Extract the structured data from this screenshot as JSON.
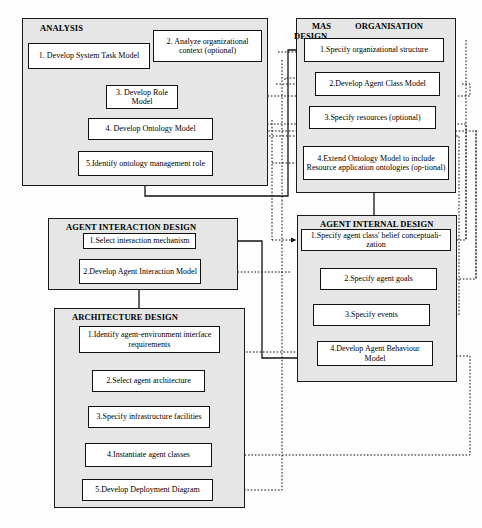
{
  "diagram": {
    "style": {
      "panel_fill": "#e6e6e6",
      "node_fill": "#ffffff",
      "line_color": "#111111",
      "page_bg": "#fdfdfd"
    },
    "panels": [
      {
        "id": "analysis",
        "label": "ANALYSIS",
        "label2": "",
        "x": 22,
        "y": 18,
        "w": 246,
        "h": 168,
        "title_x": 40,
        "title_y": 24
      },
      {
        "id": "mas-organisation-design",
        "label": "MAS",
        "label2": "ORGANISATION",
        "label3": "DESIGN",
        "x": 296,
        "y": 18,
        "w": 160,
        "h": 175,
        "title_x": 312,
        "title_y": 22
      },
      {
        "id": "agent-interaction-design",
        "label": "AGENT INTERACTION DESIGN",
        "x": 48,
        "y": 218,
        "w": 190,
        "h": 72,
        "title_x": 66,
        "title_y": 222
      },
      {
        "id": "agent-internal-design",
        "label": "AGENT INTERNAL DESIGN",
        "x": 297,
        "y": 215,
        "w": 160,
        "h": 167,
        "title_x": 320,
        "title_y": 219
      },
      {
        "id": "architecture-design",
        "label": "ARCHITECTURE DESIGN",
        "x": 54,
        "y": 308,
        "w": 191,
        "h": 200,
        "title_x": 72,
        "title_y": 312
      }
    ],
    "nodes": [
      {
        "id": "a1",
        "panel": "analysis",
        "text": "1. Develop System Task Model",
        "x": 28,
        "y": 43,
        "w": 122,
        "h": 26
      },
      {
        "id": "a2",
        "panel": "analysis",
        "text": "2. Analyze organizational context (optional)",
        "x": 153,
        "y": 30,
        "w": 109,
        "h": 32
      },
      {
        "id": "a3",
        "panel": "analysis",
        "text": "3. Develop Role Model",
        "x": 106,
        "y": 85,
        "w": 72,
        "h": 24
      },
      {
        "id": "a4",
        "panel": "analysis",
        "text": "4. Develop Ontology Model",
        "x": 88,
        "y": 118,
        "w": 125,
        "h": 22
      },
      {
        "id": "a5",
        "panel": "analysis",
        "text": "5.Identify ontology management role",
        "x": 78,
        "y": 151,
        "w": 135,
        "h": 25
      },
      {
        "id": "m1",
        "panel": "mas-organisation-design",
        "text": "1.Specify  organizational structure",
        "x": 304,
        "y": 38,
        "w": 140,
        "h": 24
      },
      {
        "id": "m2",
        "panel": "mas-organisation-design",
        "text": "2.Develop Agent Class Model",
        "x": 315,
        "y": 72,
        "w": 125,
        "h": 24
      },
      {
        "id": "m3",
        "panel": "mas-organisation-design",
        "text": "3.Specify resources (optional)",
        "x": 309,
        "y": 106,
        "w": 127,
        "h": 23
      },
      {
        "id": "m4",
        "panel": "mas-organisation-design",
        "text": "4.Extend Ontology Model to include Resource application ontologies (op-tional)",
        "x": 303,
        "y": 146,
        "w": 146,
        "h": 34
      },
      {
        "id": "i1",
        "panel": "agent-interaction-design",
        "text": "1.Select interaction mechanism",
        "x": 83,
        "y": 233,
        "w": 113,
        "h": 16
      },
      {
        "id": "i2",
        "panel": "agent-interaction-design",
        "text": "2.Develop Agent Interaction Model",
        "x": 79,
        "y": 259,
        "w": 122,
        "h": 25
      },
      {
        "id": "n1",
        "panel": "agent-internal-design",
        "text": "1.Specify agent class' belief conceptuali-zation",
        "x": 301,
        "y": 229,
        "w": 150,
        "h": 22
      },
      {
        "id": "n2",
        "panel": "agent-internal-design",
        "text": "2.Specify agent goals",
        "x": 320,
        "y": 268,
        "w": 117,
        "h": 22
      },
      {
        "id": "n3",
        "panel": "agent-internal-design",
        "text": "3.Specify events",
        "x": 313,
        "y": 304,
        "w": 117,
        "h": 22
      },
      {
        "id": "n4",
        "panel": "agent-internal-design",
        "text": "4.Develop Agent Behaviour Model",
        "x": 317,
        "y": 341,
        "w": 116,
        "h": 25
      },
      {
        "id": "r1",
        "panel": "architecture-design",
        "text": "1.Identify agent-environment interface requirements",
        "x": 79,
        "y": 326,
        "w": 141,
        "h": 27
      },
      {
        "id": "r2",
        "panel": "architecture-design",
        "text": "2.Select agent architecture",
        "x": 92,
        "y": 370,
        "w": 113,
        "h": 22
      },
      {
        "id": "r3",
        "panel": "architecture-design",
        "text": "3.Specify infrastructure facilities",
        "x": 88,
        "y": 406,
        "w": 122,
        "h": 22
      },
      {
        "id": "r4",
        "panel": "architecture-design",
        "text": "4.Instantiate agent classes",
        "x": 85,
        "y": 443,
        "w": 127,
        "h": 24
      },
      {
        "id": "r5",
        "panel": "architecture-design",
        "text": "5.Develop Deployment Diagram",
        "x": 82,
        "y": 479,
        "w": 131,
        "h": 22
      }
    ],
    "edges": [
      {
        "from": "a1",
        "to": "a3",
        "style": "solid",
        "label": ""
      },
      {
        "from": "a2",
        "to": "a3",
        "style": "solid",
        "label": ""
      },
      {
        "from": "a3",
        "to": "a4",
        "style": "solid",
        "label": ""
      },
      {
        "from": "a4",
        "to": "a5",
        "style": "solid",
        "label": ""
      },
      {
        "from": "a5",
        "to": "a1",
        "style": "dashed",
        "label": ""
      },
      {
        "from": "a5",
        "to": "a3",
        "style": "dashed",
        "label": ""
      },
      {
        "from": "a5",
        "to": "a4",
        "style": "dashed",
        "label": ""
      },
      {
        "from": "m1",
        "to": "m2",
        "style": "solid",
        "label": ""
      },
      {
        "from": "m2",
        "to": "m3",
        "style": "solid",
        "label": ""
      },
      {
        "from": "m3",
        "to": "m4",
        "style": "solid",
        "label": ""
      },
      {
        "from": "m4",
        "to": "n1",
        "style": "solid",
        "label": ""
      },
      {
        "from": "a5",
        "to": "m1",
        "style": "solid",
        "label": ""
      },
      {
        "from": "i1",
        "to": "i2",
        "style": "solid",
        "label": ""
      },
      {
        "from": "i2",
        "to": "r1",
        "style": "solid",
        "label": ""
      },
      {
        "from": "n1",
        "to": "n2",
        "style": "solid",
        "label": ""
      },
      {
        "from": "n2",
        "to": "n3",
        "style": "solid",
        "label": ""
      },
      {
        "from": "n3",
        "to": "n4",
        "style": "solid",
        "label": ""
      },
      {
        "from": "r1",
        "to": "r2",
        "style": "solid",
        "label": ""
      },
      {
        "from": "r2",
        "to": "r3",
        "style": "solid",
        "label": ""
      },
      {
        "from": "r3",
        "to": "r4",
        "style": "solid",
        "label": ""
      },
      {
        "from": "r4",
        "to": "r5",
        "style": "solid",
        "label": ""
      },
      {
        "from": "n4",
        "to": "m2",
        "style": "dashed",
        "label": ""
      },
      {
        "from": "n4",
        "to": "i1",
        "style": "solid",
        "label": ""
      },
      {
        "from": "r4",
        "to": "n4",
        "style": "dashed",
        "label": ""
      },
      {
        "from": "n2",
        "to": "a4",
        "style": "dashed",
        "label": ""
      },
      {
        "from": "n3",
        "to": "a4",
        "style": "dashed",
        "label": ""
      },
      {
        "from": "m2",
        "to": "a3",
        "style": "dashed",
        "label": ""
      },
      {
        "from": "i2",
        "to": "a4",
        "style": "dashed",
        "label": ""
      }
    ]
  }
}
